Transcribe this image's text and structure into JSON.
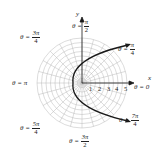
{
  "diagram": {
    "type": "polar_graph",
    "axes": {
      "x_label": "x",
      "y_label": "y"
    },
    "radial_ticks": [
      "1",
      "2",
      "3",
      "4",
      "5"
    ],
    "angle_labels": [
      {
        "theta": "θ =",
        "num": "π",
        "den": "2",
        "position": "top"
      },
      {
        "theta": "θ =",
        "num": "π",
        "den": "4",
        "position": "top-right"
      },
      {
        "theta": "θ =",
        "num": "3π",
        "den": "4",
        "position": "top-left"
      },
      {
        "theta": "θ = π",
        "position": "left"
      },
      {
        "theta": "θ = 0",
        "position": "right"
      },
      {
        "theta": "θ =",
        "num": "5π",
        "den": "4",
        "position": "bottom-left"
      },
      {
        "theta": "θ =",
        "num": "3π",
        "den": "2",
        "position": "bottom"
      },
      {
        "theta": "θ =",
        "num": "7π",
        "den": "4",
        "position": "bottom-right"
      }
    ],
    "curve": "parabola opening right, vertex near r=1 at θ=π",
    "colors": {
      "grid": "#b0b0b0",
      "curve": "#1a1a1a",
      "axes": "#1a1a1a"
    }
  }
}
